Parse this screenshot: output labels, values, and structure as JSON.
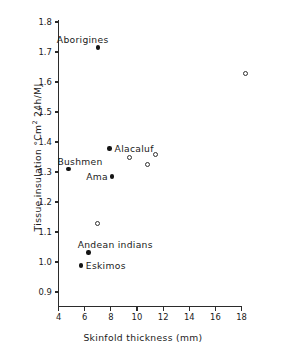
{
  "chart_data": {
    "type": "scatter",
    "title": "",
    "xlabel": "Skinfold thickness (mm)",
    "ylabel_main": "Tissue insulation",
    "ylabel_units_pre": "°Cm",
    "ylabel_units_sup": "2",
    "ylabel_units_post": " 24h/MJ",
    "xlim": [
      4,
      18
    ],
    "ylim": [
      0.9,
      1.8
    ],
    "xticks": [
      4,
      6,
      8,
      10,
      12,
      14,
      16,
      18
    ],
    "yticks": [
      "1.8",
      "1.7",
      "1.6",
      "1.5",
      "1.4",
      "1.3",
      "1.2",
      "1.1",
      "1.0",
      "0.9"
    ],
    "grid": false,
    "legend": "none",
    "series": [
      {
        "name": "labelled populations",
        "marker": "filled-circle",
        "points": [
          {
            "label": "Aborigines",
            "x": 7.0,
            "y": 1.715,
            "label_pos": "above-left"
          },
          {
            "label": "Bushmen",
            "x": 4.75,
            "y": 1.311,
            "label_pos": "above-right"
          },
          {
            "label": "Alacaluf",
            "x": 7.9,
            "y": 1.378,
            "label_pos": "right"
          },
          {
            "label": "Ama",
            "x": 8.1,
            "y": 1.285,
            "label_pos": "left"
          },
          {
            "label": "Andean indians",
            "x": 6.3,
            "y": 1.032,
            "label_pos": "above-right"
          },
          {
            "label": "Eskimos",
            "x": 5.7,
            "y": 0.988,
            "label_pos": "right"
          }
        ]
      },
      {
        "name": "unlabelled populations",
        "marker": "open-circle",
        "points": [
          {
            "label": "",
            "x": 18.3,
            "y": 1.628
          },
          {
            "label": "",
            "x": 11.4,
            "y": 1.36
          },
          {
            "label": "",
            "x": 9.4,
            "y": 1.348
          },
          {
            "label": "",
            "x": 10.8,
            "y": 1.325
          },
          {
            "label": "",
            "x": 7.0,
            "y": 1.13
          }
        ]
      }
    ]
  }
}
